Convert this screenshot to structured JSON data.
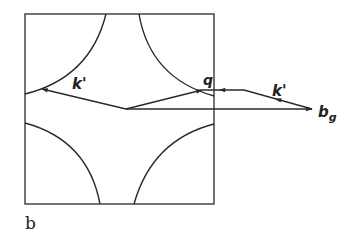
{
  "figure": {
    "panel_label": "b",
    "labels": {
      "k_prime_left": "k'",
      "k_prime_right": "k'",
      "q": "q",
      "b": "b",
      "b_subscript": "g"
    },
    "colors": {
      "stroke": "#2a2a2a",
      "background": "#ffffff"
    },
    "zone_square": {
      "x": 25,
      "y": 14,
      "width": 189,
      "height": 190
    },
    "vectors": [
      {
        "name": "k-prime-left",
        "from": [
          126,
          109
        ],
        "to": [
          42,
          89
        ]
      },
      {
        "name": "k-vector-right",
        "from": [
          126,
          109
        ],
        "to": [
          202,
          90
        ]
      },
      {
        "name": "reciprocal-lattice-vector-bg",
        "from": [
          126,
          109
        ],
        "to": [
          312,
          109
        ]
      },
      {
        "name": "k-prime-right",
        "from": [
          312,
          109
        ],
        "to": [
          244,
          90
        ]
      },
      {
        "name": "q-vector",
        "from": [
          244,
          90
        ],
        "to": [
          202,
          90
        ]
      }
    ]
  }
}
